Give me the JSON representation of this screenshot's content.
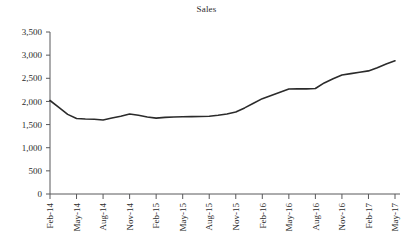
{
  "chart_data": {
    "type": "line",
    "title": "Sales",
    "xlabel": "",
    "ylabel": "",
    "ylim": [
      0,
      3500
    ],
    "ytick_values": [
      0,
      500,
      1000,
      1500,
      2000,
      2500,
      3000,
      3500
    ],
    "ytick_labels": [
      "0",
      "500",
      "1,000",
      "1,500",
      "2,000",
      "2,500",
      "3,000",
      "3,500"
    ],
    "xtick_labels": [
      "Feb-14",
      "May-14",
      "Aug-14",
      "Nov-14",
      "Feb-15",
      "May-15",
      "Aug-15",
      "Nov-15",
      "Feb-16",
      "May-16",
      "Aug-16",
      "Nov-16",
      "Feb-17",
      "May-17"
    ],
    "grid": false,
    "legend": false,
    "line_color": "#2b2b2b",
    "axis_color": "#58585a",
    "background": "#ffffff",
    "x": [
      "Feb-14",
      "Mar-14",
      "Apr-14",
      "May-14",
      "Jun-14",
      "Jul-14",
      "Aug-14",
      "Sep-14",
      "Oct-14",
      "Nov-14",
      "Dec-14",
      "Jan-15",
      "Feb-15",
      "Mar-15",
      "Apr-15",
      "May-15",
      "Jun-15",
      "Jul-15",
      "Aug-15",
      "Sep-15",
      "Oct-15",
      "Nov-15",
      "Dec-15",
      "Jan-16",
      "Feb-16",
      "Mar-16",
      "Apr-16",
      "May-16",
      "Jun-16",
      "Jul-16",
      "Aug-16",
      "Sep-16",
      "Oct-16",
      "Nov-16",
      "Dec-16",
      "Jan-17",
      "Feb-17",
      "Mar-17",
      "Apr-17",
      "May-17"
    ],
    "series": [
      {
        "name": "Sales",
        "values": [
          2020,
          1870,
          1720,
          1630,
          1620,
          1615,
          1600,
          1640,
          1680,
          1730,
          1700,
          1665,
          1640,
          1655,
          1665,
          1670,
          1672,
          1675,
          1680,
          1700,
          1730,
          1770,
          1860,
          1960,
          2060,
          2130,
          2200,
          2270,
          2275,
          2272,
          2280,
          2400,
          2490,
          2570,
          2600,
          2630,
          2660,
          2730,
          2810,
          2880
        ]
      }
    ]
  }
}
